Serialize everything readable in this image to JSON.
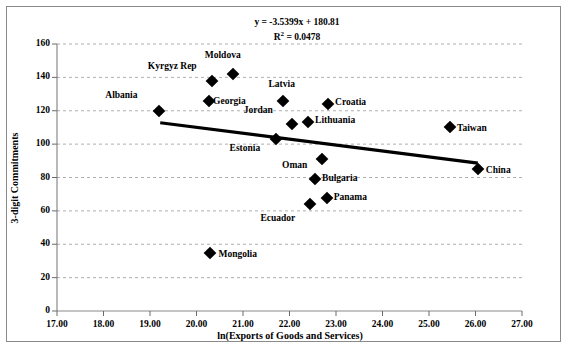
{
  "chart_data": {
    "type": "scatter",
    "title": "",
    "xlabel": "ln(Exports of Goods and Services)",
    "ylabel": "3-digit Commitments",
    "xlim": [
      17.0,
      27.0
    ],
    "ylim": [
      0,
      160
    ],
    "xticks": [
      "17.00",
      "18.00",
      "19.00",
      "20.00",
      "21.00",
      "22.00",
      "23.00",
      "24.00",
      "25.00",
      "26.00",
      "27.00"
    ],
    "yticks": [
      "0",
      "20",
      "40",
      "60",
      "80",
      "100",
      "120",
      "140",
      "160"
    ],
    "grid": true,
    "legend": "none",
    "annotations": {
      "equation": "y = -3.5399x + 180.81",
      "r_squared_prefix": "R",
      "r_squared_sup": "2",
      "r_squared_value": " = 0.0478"
    },
    "trendline": {
      "slope": -3.5399,
      "intercept": 180.81,
      "x_start": 19.22,
      "y_start": 112.8,
      "x_end": 26.05,
      "y_end": 88.6
    },
    "points": [
      {
        "label": "Albania",
        "x": 19.2,
        "y": 120,
        "label_dx": -54,
        "label_dy": -16
      },
      {
        "label": "Kyrgyz Rep",
        "x": 20.33,
        "y": 138,
        "label_dx": -64,
        "label_dy": -15
      },
      {
        "label": "Moldova",
        "x": 20.78,
        "y": 142,
        "label_dx": -28,
        "label_dy": -19
      },
      {
        "label": "Georgia",
        "x": 20.27,
        "y": 126,
        "label_dx": 4,
        "label_dy": 0
      },
      {
        "label": "Latvia",
        "x": 21.85,
        "y": 126,
        "label_dx": -14,
        "label_dy": -17
      },
      {
        "label": "Croatia",
        "x": 22.83,
        "y": 124,
        "label_dx": 7,
        "label_dy": -2
      },
      {
        "label": "Jordan",
        "x": 22.05,
        "y": 112,
        "label_dx": -48,
        "label_dy": -14
      },
      {
        "label": "Lithuania",
        "x": 22.4,
        "y": 113,
        "label_dx": 7,
        "label_dy": -2
      },
      {
        "label": "Taiwan",
        "x": 25.45,
        "y": 110,
        "label_dx": 7,
        "label_dy": 1
      },
      {
        "label": "Estonia",
        "x": 21.7,
        "y": 103,
        "label_dx": -46,
        "label_dy": 9
      },
      {
        "label": "Oman",
        "x": 22.7,
        "y": 91,
        "label_dx": -40,
        "label_dy": 6
      },
      {
        "label": "Bulgaria",
        "x": 22.55,
        "y": 79,
        "label_dx": 7,
        "label_dy": -1
      },
      {
        "label": "Panama",
        "x": 22.8,
        "y": 68,
        "label_dx": 7,
        "label_dy": -1
      },
      {
        "label": "Ecuador",
        "x": 22.45,
        "y": 64,
        "label_dx": -50,
        "label_dy": 14
      },
      {
        "label": "Mongolia",
        "x": 20.3,
        "y": 35,
        "label_dx": 8,
        "label_dy": 1
      },
      {
        "label": "China",
        "x": 26.05,
        "y": 85,
        "label_dx": 8,
        "label_dy": 1
      }
    ]
  }
}
